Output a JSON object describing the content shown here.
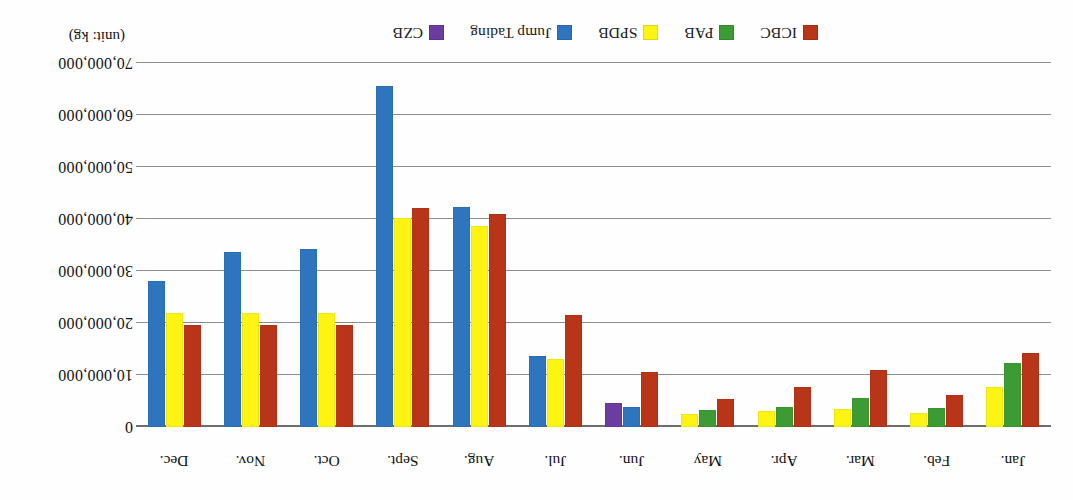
{
  "chart_data": {
    "type": "bar",
    "title": "",
    "subtitle": "",
    "xlabel": "",
    "ylabel": "",
    "unit_label": "(unit: kg)",
    "orientation": "rotated-180",
    "grid": true,
    "legend_position": "top",
    "ylim": [
      0,
      70000000
    ],
    "ytick_values": [
      0,
      10000000,
      20000000,
      30000000,
      40000000,
      50000000,
      60000000,
      70000000
    ],
    "ytick_labels": [
      "0",
      "10,000,000",
      "20,000,000",
      "30,000,000",
      "40,000,000",
      "50,000,000",
      "60,000,000",
      "70,000,000"
    ],
    "categories": [
      "Jan.",
      "Feb.",
      "Mar.",
      "Apr.",
      "May",
      "Jun.",
      "Jul.",
      "Aug.",
      "Sept.",
      "Oct.",
      "Nov.",
      "Dec."
    ],
    "series": [
      {
        "name": "ICBC",
        "color": "#b8351a",
        "values": [
          14200000,
          6100000,
          11000000,
          7600000,
          5400000,
          10500000,
          21600000,
          41000000,
          42200000,
          19600000,
          19600000,
          19600000
        ]
      },
      {
        "name": "PAB",
        "color": "#3d9b35",
        "values": [
          12400000,
          3600000,
          5600000,
          3900000,
          3300000,
          null,
          null,
          null,
          null,
          null,
          null,
          null
        ]
      },
      {
        "name": "SPDB",
        "color": "#fdf414",
        "values": [
          7700000,
          2600000,
          3400000,
          3100000,
          2500000,
          null,
          13100000,
          38600000,
          40100000,
          22000000,
          22000000,
          22000000
        ]
      },
      {
        "name": "Jump Tading",
        "color": "#2e75bd",
        "values": [
          null,
          null,
          null,
          null,
          null,
          3800000,
          13600000,
          42400000,
          65500000,
          34200000,
          33600000,
          28100000
        ]
      },
      {
        "name": "CZB",
        "color": "#6b3da0",
        "values": [
          null,
          null,
          null,
          null,
          null,
          4600000,
          null,
          null,
          null,
          null,
          null,
          null
        ]
      }
    ]
  },
  "legend": {
    "items": [
      {
        "label": "ICBC",
        "color": "#b8351a"
      },
      {
        "label": "PAB",
        "color": "#3d9b35"
      },
      {
        "label": "SPDB",
        "color": "#fdf414"
      },
      {
        "label": "Jump Tading",
        "color": "#2e75bd"
      },
      {
        "label": "CZB",
        "color": "#6b3da0"
      }
    ]
  }
}
